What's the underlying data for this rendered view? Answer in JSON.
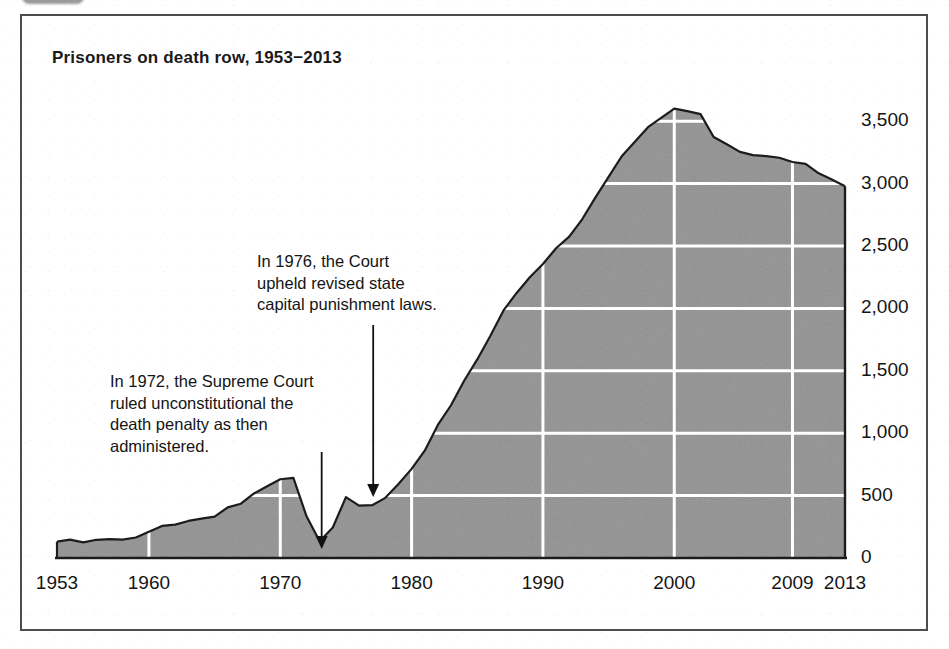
{
  "figure": {
    "title": "Prisoners on death row, 1953−2013",
    "clipped_badge_label": ""
  },
  "annotations": [
    {
      "id": "annotation-1972",
      "text": "In 1972, the Supreme Court\nruled unconstitutional the\ndeath penalty as then\nadministered.",
      "points_to_year": 1973
    },
    {
      "id": "annotation-1976",
      "text": "In 1976, the Court\nupheld revised state\ncapital punishment laws.",
      "points_to_year": 1977
    }
  ],
  "colors": {
    "area_fill": "#9b9b9b",
    "area_line": "#1c1c1c",
    "gridline": "#ffffff",
    "axis": "#1c1c1c",
    "frame": "#4d4d4d",
    "text": "#141414"
  },
  "chart_data": {
    "type": "area",
    "title": "Prisoners on death row, 1953−2013",
    "xlabel": "",
    "ylabel": "",
    "xlim": [
      1953,
      2013
    ],
    "ylim": [
      0,
      3750
    ],
    "grid": true,
    "legend": "none",
    "y_ticks": [
      0,
      500,
      1000,
      1500,
      2000,
      2500,
      3000,
      3500
    ],
    "y_tick_labels": [
      "0",
      "500",
      "1,000",
      "1,500",
      "2,000",
      "2,500",
      "3,000",
      "3,500"
    ],
    "x_ticks": [
      1953,
      1960,
      1970,
      1980,
      1990,
      2000,
      2009,
      2013
    ],
    "x_tick_labels": [
      "1953",
      "1960",
      "1970",
      "1980",
      "1990",
      "2000",
      "2009",
      "2013"
    ],
    "x": [
      1953,
      1954,
      1955,
      1956,
      1957,
      1958,
      1959,
      1960,
      1961,
      1962,
      1963,
      1964,
      1965,
      1966,
      1967,
      1968,
      1969,
      1970,
      1971,
      1972,
      1973,
      1974,
      1975,
      1976,
      1977,
      1978,
      1979,
      1980,
      1981,
      1982,
      1983,
      1984,
      1985,
      1986,
      1987,
      1988,
      1989,
      1990,
      1991,
      1992,
      1993,
      1994,
      1995,
      1996,
      1997,
      1998,
      1999,
      2000,
      2001,
      2002,
      2003,
      2004,
      2005,
      2006,
      2007,
      2008,
      2009,
      2010,
      2011,
      2012,
      2013
    ],
    "series": [
      {
        "name": "Prisoners on death row",
        "values": [
          131,
          147,
          125,
          146,
          151,
          147,
          164,
          210,
          257,
          267,
          297,
          315,
          331,
          406,
          435,
          517,
          575,
          631,
          642,
          334,
          134,
          244,
          488,
          420,
          423,
          482,
          593,
          714,
          860,
          1066,
          1224,
          1420,
          1591,
          1781,
          1984,
          2124,
          2250,
          2356,
          2482,
          2575,
          2716,
          2890,
          3054,
          3219,
          3335,
          3452,
          3527,
          3601,
          3581,
          3557,
          3374,
          3315,
          3254,
          3228,
          3220,
          3207,
          3173,
          3158,
          3082,
          3033,
          2979
        ]
      }
    ],
    "notes": [
      "In 1972, the Supreme Court ruled unconstitutional the death penalty as then administered.",
      "In 1976, the Court upheld revised state capital punishment laws."
    ]
  }
}
